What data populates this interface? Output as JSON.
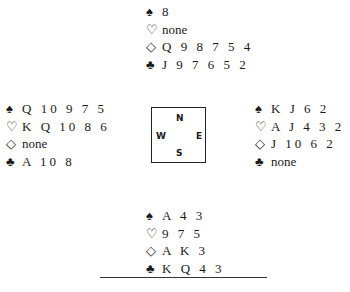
{
  "diagram": {
    "type": "bridge-deal",
    "icons": {
      "spades": "♠",
      "hearts": "♡",
      "diamonds": "◇",
      "clubs": "♣"
    },
    "north": {
      "spades": "8",
      "hearts": "none",
      "diamonds": "Q 9 8 7 5 4",
      "clubs": "J 9 7 6 5 2"
    },
    "west": {
      "spades": "Q 10 9 7 5",
      "hearts": "K Q 10 8 6",
      "diamonds": "none",
      "clubs": "A 10 8"
    },
    "east": {
      "spades": "K J 6 2",
      "hearts": "A J 4 3 2",
      "diamonds": "J 10 6 2",
      "clubs": "none"
    },
    "south": {
      "spades": "A 4 3",
      "hearts": "9 7 5",
      "diamonds": "A K 3",
      "clubs": "K Q 4 3"
    },
    "compass": {
      "n": "N",
      "s": "S",
      "w": "W",
      "e": "E"
    }
  }
}
